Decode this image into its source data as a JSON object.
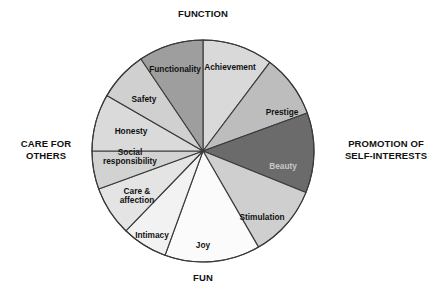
{
  "diagram": {
    "title_axes": {
      "top": "FUNCTION",
      "right": "PROMOTION OF\nSELF-INTERESTS",
      "bottom": "FUN",
      "left": "CARE FOR\nOTHERS"
    }
  },
  "chart_data": {
    "type": "pie",
    "title": "",
    "xlabel": "",
    "ylabel": "",
    "legend_position": "none",
    "grid": false,
    "center": {
      "x": 203,
      "y": 151
    },
    "radius": 111,
    "start_angle_deg": 0,
    "direction": "clockwise",
    "stroke_color": "#3a3a3a",
    "categories": [
      "Achievement",
      "Prestige",
      "Beauty",
      "Stimulation",
      "Joy",
      "Intimacy",
      "Care & affection",
      "Social responsibility",
      "Honesty",
      "Safety",
      "Functionality"
    ],
    "values": [
      37,
      33,
      42,
      38,
      50,
      24,
      26,
      31,
      30,
      26,
      33
    ],
    "colors": [
      "#d9d9d9",
      "#bdbdbd",
      "#6b6b6b",
      "#cfcfcf",
      "#fbfbfb",
      "#f2f2f2",
      "#e4e4e4",
      "#d2d2d2",
      "#dadada",
      "#d0d0d0",
      "#9e9e9e"
    ],
    "label_colors": [
      "#111111",
      "#111111",
      "#c9c9c9",
      "#111111",
      "#111111",
      "#111111",
      "#111111",
      "#111111",
      "#111111",
      "#111111",
      "#111111"
    ],
    "slices": [
      {
        "label": "Achievement",
        "start_deg": 0,
        "end_deg": 37,
        "color": "#d9d9d9",
        "label_x": 230,
        "label_y": 68,
        "text_color": "dark"
      },
      {
        "label": "Prestige",
        "start_deg": 37,
        "end_deg": 70,
        "color": "#bdbdbd",
        "label_x": 282,
        "label_y": 113,
        "text_color": "dark"
      },
      {
        "label": "Beauty",
        "start_deg": 70,
        "end_deg": 112,
        "color": "#6b6b6b",
        "label_x": 283,
        "label_y": 167,
        "text_color": "light"
      },
      {
        "label": "Stimulation",
        "start_deg": 112,
        "end_deg": 150,
        "color": "#cfcfcf",
        "label_x": 262,
        "label_y": 218,
        "text_color": "dark"
      },
      {
        "label": "Joy",
        "start_deg": 150,
        "end_deg": 200,
        "color": "#fbfbfb",
        "label_x": 203,
        "label_y": 246,
        "text_color": "dark"
      },
      {
        "label": "Intimacy",
        "start_deg": 200,
        "end_deg": 224,
        "color": "#f2f2f2",
        "label_x": 152,
        "label_y": 236,
        "text_color": "dark"
      },
      {
        "label": "Care &\naffection",
        "start_deg": 224,
        "end_deg": 250,
        "color": "#e4e4e4",
        "label_x": 137,
        "label_y": 196,
        "text_color": "dark"
      },
      {
        "label": "Social\nresponsibility",
        "start_deg": 250,
        "end_deg": 270,
        "color": "#d2d2d2",
        "label_x": 130,
        "label_y": 157,
        "text_color": "dark"
      },
      {
        "label": "Honesty",
        "start_deg": 270,
        "end_deg": 300,
        "color": "#dadada",
        "label_x": 131,
        "label_y": 132,
        "text_color": "dark"
      },
      {
        "label": "Safety",
        "start_deg": 300,
        "end_deg": 326,
        "color": "#d0d0d0",
        "label_x": 144,
        "label_y": 100,
        "text_color": "dark"
      },
      {
        "label": "Functionality",
        "start_deg": 326,
        "end_deg": 360,
        "color": "#9e9e9e",
        "label_x": 175,
        "label_y": 70,
        "text_color": "dark"
      }
    ]
  }
}
